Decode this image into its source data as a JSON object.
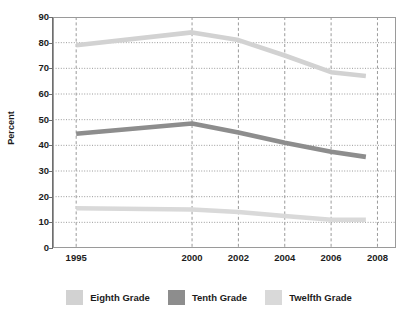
{
  "chart_data": {
    "type": "line",
    "title": "",
    "xlabel": "",
    "ylabel": "Percent",
    "ylim": [
      0,
      90
    ],
    "ytick_values": [
      90,
      80,
      70,
      60,
      50,
      40,
      30,
      20,
      10,
      0
    ],
    "ytick_labels": [
      "90",
      "80",
      "70",
      "60",
      "50",
      "40",
      "30",
      "20",
      "10",
      "0"
    ],
    "x": [
      1995,
      2000,
      2002,
      2004,
      2006,
      2008
    ],
    "xtick_labels": [
      "1995",
      "2000",
      "2002",
      "2004",
      "2006",
      "2008"
    ],
    "xlim": [
      1994,
      2008.8
    ],
    "grid": "both",
    "legend_position": "bottom",
    "series": [
      {
        "name": "Eighth Grade",
        "color": "#d2d2d2",
        "x": [
          1995,
          2000,
          2002,
          2004,
          2006,
          2007.5
        ],
        "values": [
          79,
          84,
          81,
          75,
          68.5,
          67
        ]
      },
      {
        "name": "Tenth Grade",
        "color": "#8d8d8d",
        "x": [
          1995,
          2000,
          2002,
          2004,
          2006,
          2007.5
        ],
        "values": [
          44.5,
          48.5,
          45,
          41,
          37.5,
          35.5
        ]
      },
      {
        "name": "Twelfth Grade",
        "color": "#d9d9d9",
        "x": [
          1995,
          2000,
          2002,
          2004,
          2006,
          2007.5
        ],
        "values": [
          15.5,
          15,
          14,
          12.5,
          11,
          11
        ]
      }
    ]
  },
  "legend": {
    "items": [
      {
        "label": "Eighth Grade",
        "color": "#d2d2d2"
      },
      {
        "label": "Tenth Grade",
        "color": "#8d8d8d"
      },
      {
        "label": "Twelfth Grade",
        "color": "#d9d9d9"
      }
    ]
  },
  "colors": {
    "frame": "#9a9a9a",
    "gridline": "#9a9a9a",
    "text": "#1c1c1c",
    "background": "#ffffff"
  }
}
